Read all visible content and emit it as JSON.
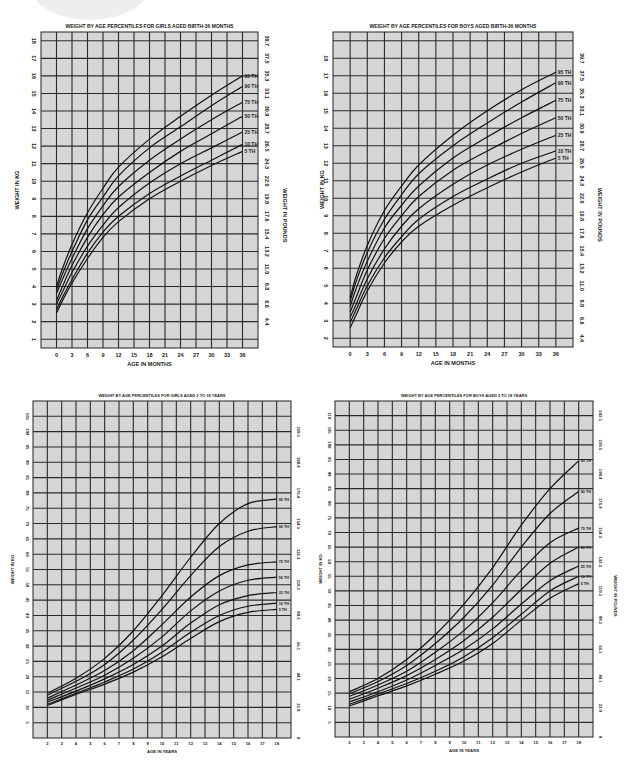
{
  "chart_data": [
    {
      "id": "girls-infant",
      "type": "line",
      "title": "WEIGHT BY AGE PERCENTILES FOR GIRLS AGED BIRTH-36 MONTHS",
      "xlabel": "AGE IN MONTHS",
      "ylabel": "WEIGHT IN KG",
      "y2label": "WEIGHT IN POUNDS",
      "xlim": [
        -3,
        39
      ],
      "ylim": [
        0.5,
        18.5
      ],
      "grid": true,
      "x_ticks": [
        0,
        3,
        6,
        9,
        12,
        15,
        18,
        21,
        24,
        27,
        30,
        33,
        36
      ],
      "x_tick_labels": [
        "0",
        "3",
        "6",
        "9",
        "12",
        "15",
        "18",
        "21",
        "24",
        "27",
        "30",
        "33",
        "36"
      ],
      "y_ticks": [
        1,
        2,
        3,
        4,
        5,
        6,
        7,
        8,
        9,
        10,
        11,
        12,
        13,
        14,
        15,
        16,
        17,
        18
      ],
      "y2_ticks": [
        2,
        3,
        4,
        5,
        6,
        7,
        8,
        9,
        10,
        11,
        12,
        13,
        14,
        15,
        16,
        17,
        18
      ],
      "y2_tick_labels": [
        "4.4",
        "6.6",
        "8.8",
        "11.0",
        "13.2",
        "15.4",
        "17.6",
        "19.8",
        "22.0",
        "24.3",
        "26.5",
        "28.7",
        "30.9",
        "33.1",
        "35.3",
        "37.5",
        "39.7"
      ],
      "x": [
        0,
        1,
        3,
        6,
        9,
        12,
        18,
        24,
        30,
        36
      ],
      "series": [
        {
          "name": "95 TH",
          "values": [
            4.0,
            4.9,
            6.4,
            8.2,
            9.6,
            10.8,
            12.4,
            13.7,
            14.9,
            16.0
          ]
        },
        {
          "name": "90 TH",
          "values": [
            3.8,
            4.6,
            6.0,
            7.8,
            9.1,
            10.3,
            11.9,
            13.1,
            14.3,
            15.4
          ]
        },
        {
          "name": "75 TH",
          "values": [
            3.6,
            4.3,
            5.6,
            7.3,
            8.6,
            9.7,
            11.2,
            12.4,
            13.5,
            14.5
          ]
        },
        {
          "name": "50 TH",
          "values": [
            3.2,
            3.9,
            5.2,
            6.8,
            8.1,
            9.1,
            10.5,
            11.7,
            12.7,
            13.7
          ]
        },
        {
          "name": "25 TH",
          "values": [
            3.0,
            3.6,
            4.8,
            6.3,
            7.5,
            8.5,
            9.9,
            11.0,
            11.9,
            12.8
          ]
        },
        {
          "name": "10 TH",
          "values": [
            2.7,
            3.3,
            4.4,
            5.9,
            7.1,
            8.0,
            9.3,
            10.3,
            11.2,
            12.1
          ]
        },
        {
          "name": "5 TH",
          "values": [
            2.5,
            3.1,
            4.2,
            5.6,
            6.8,
            7.7,
            9.0,
            10.0,
            10.9,
            11.7
          ]
        }
      ]
    },
    {
      "id": "boys-infant",
      "type": "line",
      "title": "WEIGHT BY AGE PERCENTILES FOR BOYS AGED BIRTH-36 MONTHS",
      "xlabel": "AGE IN MONTHS",
      "ylabel": "WEIGHT IN KG",
      "y2label": "WEIGHT IN POUNDS",
      "xlim": [
        -3,
        39
      ],
      "ylim": [
        1.5,
        19.5
      ],
      "grid": true,
      "x_ticks": [
        0,
        3,
        6,
        9,
        12,
        15,
        18,
        21,
        24,
        27,
        30,
        33,
        36
      ],
      "x_tick_labels": [
        "0",
        "3",
        "6",
        "9",
        "12",
        "15",
        "18",
        "21",
        "24",
        "27",
        "30",
        "33",
        "36"
      ],
      "y_ticks": [
        2,
        3,
        4,
        5,
        6,
        7,
        8,
        9,
        10,
        11,
        12,
        13,
        14,
        15,
        16,
        17,
        18
      ],
      "y2_ticks": [
        2,
        3,
        4,
        5,
        6,
        7,
        8,
        9,
        10,
        11,
        12,
        13,
        14,
        15,
        16,
        17,
        18
      ],
      "y2_tick_labels": [
        "4.4",
        "6.6",
        "8.8",
        "11.0",
        "13.2",
        "15.4",
        "17.6",
        "19.8",
        "22.0",
        "24.3",
        "26.5",
        "28.7",
        "30.9",
        "33.1",
        "35.3",
        "37.5",
        "39.7"
      ],
      "x": [
        0,
        1,
        3,
        6,
        9,
        12,
        18,
        24,
        30,
        36
      ],
      "series": [
        {
          "name": "95 TH",
          "values": [
            4.3,
            5.5,
            7.3,
            9.3,
            10.7,
            11.9,
            13.6,
            15.0,
            16.2,
            17.2
          ]
        },
        {
          "name": "90 TH",
          "values": [
            4.1,
            5.2,
            6.9,
            8.8,
            10.2,
            11.4,
            13.0,
            14.3,
            15.5,
            16.6
          ]
        },
        {
          "name": "75 TH",
          "values": [
            3.8,
            4.8,
            6.4,
            8.3,
            9.6,
            10.7,
            12.3,
            13.5,
            14.6,
            15.6
          ]
        },
        {
          "name": "50 TH",
          "values": [
            3.5,
            4.3,
            5.9,
            7.7,
            9.0,
            10.1,
            11.6,
            12.7,
            13.7,
            14.6
          ]
        },
        {
          "name": "25 TH",
          "values": [
            3.2,
            3.9,
            5.4,
            7.1,
            8.4,
            9.4,
            10.8,
            11.9,
            12.8,
            13.6
          ]
        },
        {
          "name": "10 TH",
          "values": [
            2.9,
            3.6,
            5.0,
            6.6,
            7.8,
            8.8,
            10.1,
            11.1,
            12.0,
            12.7
          ]
        },
        {
          "name": "5 TH",
          "values": [
            2.6,
            3.3,
            4.7,
            6.3,
            7.5,
            8.4,
            9.6,
            10.6,
            11.5,
            12.3
          ]
        }
      ]
    },
    {
      "id": "girls-child",
      "type": "line",
      "title": "WEIGHT BY AGE PERCENTILES FOR GIRLS AGED 2 TO 18 YEARS",
      "xlabel": "AGE IN YEARS",
      "ylabel": "WEIGHT IN KG",
      "y2label": "WEIGHT IN POUNDS",
      "xlim": [
        1,
        19
      ],
      "ylim": [
        0,
        110
      ],
      "grid": true,
      "x_ticks": [
        2,
        3,
        4,
        5,
        6,
        7,
        8,
        9,
        10,
        11,
        12,
        13,
        14,
        15,
        16,
        17,
        18
      ],
      "x_tick_labels": [
        "2",
        "3",
        "4",
        "5",
        "6",
        "7",
        "8",
        "9",
        "10",
        "11",
        "12",
        "13",
        "14",
        "15",
        "16",
        "17",
        "18"
      ],
      "y_ticks": [
        5,
        10,
        15,
        20,
        25,
        30,
        35,
        40,
        45,
        50,
        55,
        60,
        65,
        70,
        75,
        80,
        85,
        90,
        95,
        100,
        105
      ],
      "y2_ticks": [
        0,
        10,
        20,
        30,
        40,
        50,
        60,
        70,
        80,
        90,
        100
      ],
      "y2_tick_labels": [
        "0",
        "22.0",
        "44.1",
        "66.1",
        "88.2",
        "110.2",
        "132.3",
        "154.3",
        "176.4",
        "198.4",
        "220.5"
      ],
      "x": [
        2,
        4,
        6,
        8,
        10,
        12,
        14,
        16,
        18
      ],
      "series": [
        {
          "name": "95 TH",
          "values": [
            14.6,
            19.5,
            26.0,
            35.0,
            46.5,
            59.0,
            70.0,
            76.5,
            78.0
          ]
        },
        {
          "name": "90 TH",
          "values": [
            14.0,
            18.5,
            24.0,
            32.0,
            42.0,
            53.0,
            62.5,
            67.5,
            69.0
          ]
        },
        {
          "name": "75 TH",
          "values": [
            13.0,
            17.3,
            22.0,
            28.5,
            37.0,
            46.0,
            53.0,
            56.5,
            57.5
          ]
        },
        {
          "name": "50 TH",
          "values": [
            12.3,
            16.3,
            20.5,
            26.0,
            33.0,
            41.5,
            48.0,
            51.5,
            52.5
          ]
        },
        {
          "name": "25 TH",
          "values": [
            11.7,
            15.3,
            19.3,
            24.0,
            30.0,
            37.5,
            43.5,
            46.5,
            47.5
          ]
        },
        {
          "name": "10 TH",
          "values": [
            11.0,
            14.6,
            18.3,
            22.5,
            28.0,
            34.5,
            40.0,
            43.0,
            44.0
          ]
        },
        {
          "name": "5 TH",
          "values": [
            10.6,
            14.2,
            17.6,
            21.5,
            26.5,
            32.5,
            38.0,
            41.0,
            42.0
          ]
        }
      ]
    },
    {
      "id": "boys-child",
      "type": "line",
      "title": "WEIGHT BY AGE PERCENTILES FOR BOYS AGED 2 TO 18 YEARS",
      "xlabel": "AGE IN YEARS",
      "ylabel": "WEIGHT IN KG",
      "y2label": "WEIGHT IN POUNDS",
      "xlim": [
        1,
        19
      ],
      "ylim": [
        0,
        115
      ],
      "grid": true,
      "x_ticks": [
        2,
        3,
        4,
        5,
        6,
        7,
        8,
        9,
        10,
        11,
        12,
        13,
        14,
        15,
        16,
        17,
        18
      ],
      "x_tick_labels": [
        "2",
        "3",
        "4",
        "5",
        "6",
        "7",
        "8",
        "9",
        "10",
        "11",
        "12",
        "13",
        "14",
        "15",
        "16",
        "17",
        "18"
      ],
      "y_ticks": [
        5,
        10,
        15,
        20,
        25,
        30,
        35,
        40,
        45,
        50,
        55,
        60,
        65,
        70,
        75,
        80,
        85,
        90,
        95,
        100,
        105,
        110
      ],
      "y2_ticks": [
        0,
        10,
        20,
        30,
        40,
        50,
        60,
        70,
        80,
        90,
        100,
        110
      ],
      "y2_tick_labels": [
        "0",
        "22.0",
        "44.1",
        "66.1",
        "88.2",
        "110.2",
        "132.3",
        "154.3",
        "176.4",
        "198.4",
        "220.5",
        "242.5"
      ],
      "x": [
        2,
        4,
        6,
        8,
        10,
        12,
        14,
        16,
        18
      ],
      "series": [
        {
          "name": "95 TH",
          "values": [
            15.5,
            20.0,
            26.5,
            35.0,
            45.5,
            58.0,
            72.5,
            85.0,
            94.5
          ]
        },
        {
          "name": "90 TH",
          "values": [
            14.8,
            19.0,
            24.5,
            32.0,
            41.0,
            52.0,
            65.0,
            76.5,
            84.0
          ]
        },
        {
          "name": "75 TH",
          "values": [
            13.9,
            17.8,
            22.5,
            29.0,
            36.5,
            46.0,
            57.0,
            66.5,
            71.5
          ]
        },
        {
          "name": "50 TH",
          "values": [
            12.9,
            16.7,
            21.0,
            26.5,
            33.0,
            41.0,
            50.5,
            59.5,
            65.0
          ]
        },
        {
          "name": "25 TH",
          "values": [
            12.0,
            15.5,
            19.5,
            24.5,
            30.0,
            37.0,
            45.5,
            53.5,
            58.5
          ]
        },
        {
          "name": "10 TH",
          "values": [
            11.2,
            14.7,
            18.3,
            22.5,
            27.5,
            34.0,
            42.0,
            50.0,
            55.0
          ]
        },
        {
          "name": "5 TH",
          "values": [
            10.6,
            14.1,
            17.5,
            21.5,
            26.0,
            32.0,
            40.0,
            47.5,
            52.5
          ]
        }
      ]
    }
  ]
}
